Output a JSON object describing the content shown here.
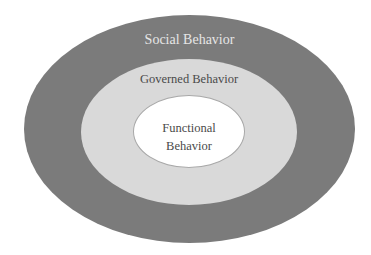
{
  "diagram": {
    "type": "nested-ellipses",
    "layers": [
      {
        "id": "outer",
        "label": "Social Behavior",
        "fill": "#7b7b7b",
        "text_color": "#e6e6e6"
      },
      {
        "id": "middle",
        "label": "Governed Behavior",
        "fill": "#d9d9d9",
        "text_color": "#4a4a4a"
      },
      {
        "id": "inner",
        "label_lines": [
          "Functional",
          "Behavior"
        ],
        "fill": "#ffffff",
        "text_color": "#4a4a4a"
      }
    ]
  }
}
